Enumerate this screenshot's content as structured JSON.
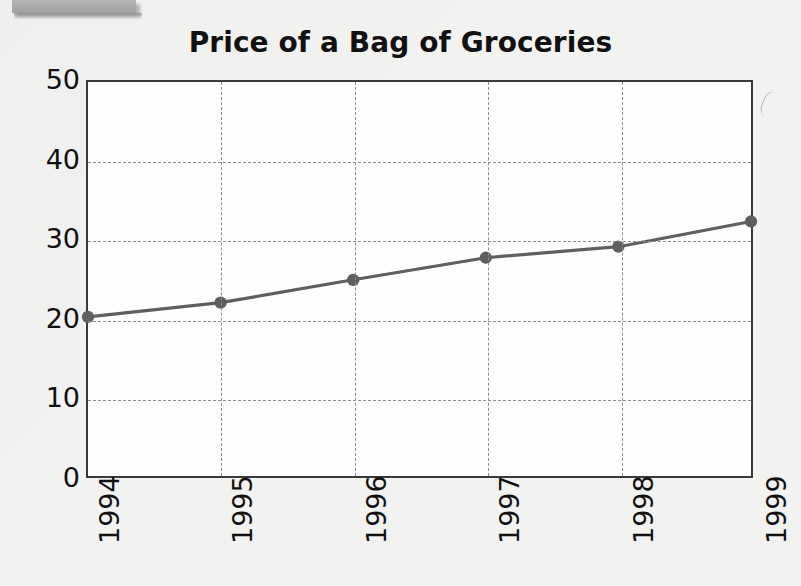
{
  "page": {
    "background_color": "#f2f2f0",
    "artifact_bar_color": "#a9a9a9"
  },
  "chart_data": {
    "type": "line",
    "title": "Price of a Bag of Groceries",
    "xlabel": "",
    "ylabel": "",
    "categories": [
      "1994",
      "1995",
      "1996",
      "1997",
      "1998",
      "1999"
    ],
    "values": [
      20.2,
      22.0,
      24.9,
      27.7,
      29.1,
      32.3
    ],
    "series": [
      {
        "name": "Price of a Bag of Groceries",
        "values": [
          20.2,
          22.0,
          24.9,
          27.7,
          29.1,
          32.3
        ]
      }
    ],
    "ylim": [
      0,
      50
    ],
    "yticks": [
      "0",
      "10",
      "20",
      "30",
      "40",
      "50"
    ],
    "ytick_values": [
      0,
      10,
      20,
      30,
      40,
      50
    ],
    "xticks": [
      "1994",
      "1995",
      "1996",
      "1997",
      "1998",
      "1999"
    ],
    "xtick_rotation": -90,
    "grid": true,
    "grid_style": "dashed",
    "grid_color": "#8d8d8d",
    "legend": false,
    "legend_position": "none",
    "line_color": "#5f5f5f",
    "marker": "circle",
    "marker_color": "#5f5f5f",
    "axis_color": "#3a3a3a",
    "plot_background": "#fefefe",
    "annotations": []
  }
}
